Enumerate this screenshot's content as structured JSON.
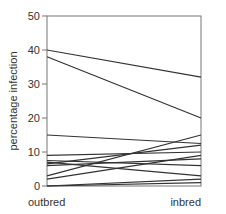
{
  "chart_data": {
    "type": "line",
    "title": "",
    "xlabel": "",
    "ylabel": "percentage infection",
    "categories": [
      "outbred",
      "inbred"
    ],
    "ylim": [
      0,
      50
    ],
    "yticks": [
      0,
      10,
      20,
      30,
      40,
      50
    ],
    "grid": false,
    "legend": "none",
    "series": [
      {
        "name": "line1",
        "values": [
          40,
          32
        ]
      },
      {
        "name": "line2",
        "values": [
          38,
          20
        ]
      },
      {
        "name": "line3",
        "values": [
          15,
          12.5
        ]
      },
      {
        "name": "line4",
        "values": [
          9,
          10
        ]
      },
      {
        "name": "line5",
        "values": [
          7.5,
          6
        ]
      },
      {
        "name": "line6",
        "values": [
          7,
          3
        ]
      },
      {
        "name": "line7",
        "values": [
          6.5,
          12
        ]
      },
      {
        "name": "line8",
        "values": [
          6,
          8
        ]
      },
      {
        "name": "line9",
        "values": [
          3,
          15
        ]
      },
      {
        "name": "line10",
        "values": [
          2,
          9
        ]
      },
      {
        "name": "line11",
        "values": [
          0,
          2
        ]
      },
      {
        "name": "line12",
        "values": [
          0,
          1
        ]
      }
    ]
  },
  "labels": {
    "ylabel": "percentage infection",
    "x_left": "outbred",
    "x_right": "inbred"
  }
}
